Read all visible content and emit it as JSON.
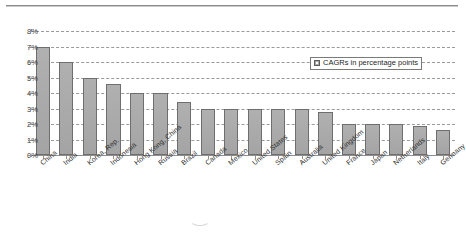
{
  "chart_data": {
    "type": "bar",
    "title": "",
    "xlabel": "",
    "ylabel": "",
    "ylim": [
      0,
      8
    ],
    "ytick_labels": [
      "8%",
      "7%",
      "6%",
      "5%",
      "4%",
      "3%",
      "2%",
      "1%",
      "0%"
    ],
    "ytick_values": [
      8,
      7,
      6,
      5,
      4,
      3,
      2,
      1,
      0
    ],
    "grid": true,
    "grid_style": "dashed-horizontal",
    "legend": [
      "CAGRs in percentage points"
    ],
    "legend_position": "top-right-inside",
    "bar_color": "#a9a9a9",
    "bar_edge_color": "#6e6e6e",
    "categories": [
      "China",
      "India",
      "Korea, Rep.",
      "Indonesia",
      "Hong Kong, China",
      "Russia",
      "Brazil",
      "Canada",
      "Mexico",
      "United States",
      "Spain",
      "Australia",
      "United Kingdom",
      "France",
      "Japan",
      "Netherlands",
      "Italy",
      "Germany"
    ],
    "values": [
      7.0,
      6.0,
      5.0,
      4.6,
      4.0,
      4.0,
      3.4,
      3.0,
      3.0,
      3.0,
      3.0,
      3.0,
      2.8,
      2.0,
      2.0,
      2.0,
      1.9,
      1.6
    ],
    "series": [
      {
        "name": "CAGRs in percentage points",
        "values": [
          7.0,
          6.0,
          5.0,
          4.6,
          4.0,
          4.0,
          3.4,
          3.0,
          3.0,
          3.0,
          3.0,
          3.0,
          2.8,
          2.0,
          2.0,
          2.0,
          1.9,
          1.6
        ]
      }
    ]
  },
  "artifact": "‿"
}
